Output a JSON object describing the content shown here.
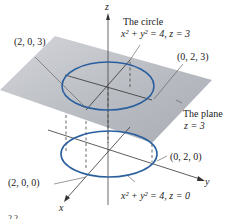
{
  "axes": {
    "x_label": "x",
    "y_label": "y",
    "z_label": "z"
  },
  "labels": {
    "circle_title": "The circle",
    "circle_eq_upper": "x² + y² = 4, z = 3",
    "point_203": "(2, 0, 3)",
    "point_023": "(0, 2, 3)",
    "plane_title": "The plane",
    "plane_eq": "z = 3",
    "point_020": "(0, 2, 0)",
    "point_200": "(2, 0, 0)",
    "circle_eq_lower": "x² + y² = 4, z = 0",
    "cut_off_text": "2    2"
  },
  "colors": {
    "circle": "#2a5f9e",
    "plane": "#b9bcc2",
    "axis": "#333333",
    "text": "#222222"
  }
}
